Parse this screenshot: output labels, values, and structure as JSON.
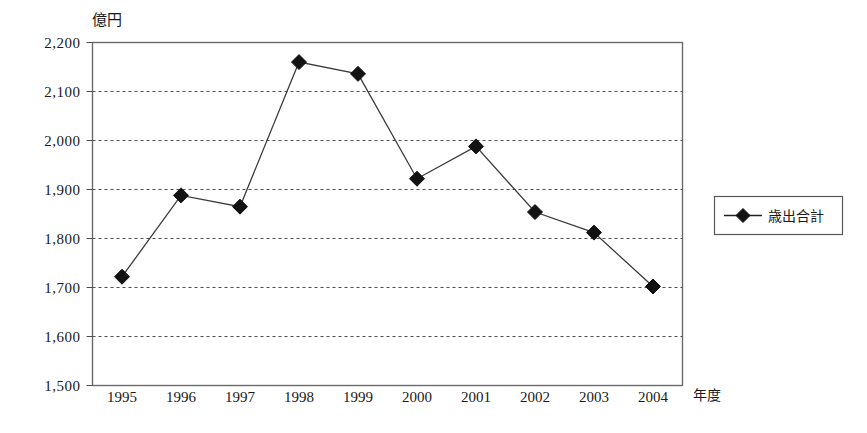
{
  "chart_data": {
    "type": "line",
    "title": "",
    "xlabel": "年度",
    "ylabel": "億円",
    "categories": [
      "1995",
      "1996",
      "1997",
      "1998",
      "1999",
      "2000",
      "2001",
      "2002",
      "2003",
      "2004"
    ],
    "series": [
      {
        "name": "歳出合計",
        "values": [
          1722,
          1888,
          1865,
          2160,
          2136,
          1922,
          1988,
          1854,
          1812,
          1702
        ],
        "marker": "diamond",
        "color": "#121212"
      }
    ],
    "ylim": [
      1500,
      2200
    ],
    "yticks": [
      1500,
      1600,
      1700,
      1800,
      1900,
      2000,
      2100,
      2200
    ],
    "ytick_labels": [
      "1,500",
      "1,600",
      "1,700",
      "1,800",
      "1,900",
      "2,000",
      "2,100",
      "2,200"
    ],
    "grid": true,
    "grid_style": "dashed-horizontal",
    "legend_position": "right",
    "legend_entries": [
      "歳出合計"
    ]
  },
  "axes": {
    "y_unit_label": "億円",
    "x_axis_title": "年度"
  },
  "legend": {
    "items": [
      {
        "label": "歳出合計",
        "marker": "diamond",
        "color": "#121212"
      }
    ]
  },
  "colors": {
    "series": "#121212",
    "grid": "#4d4d4d",
    "border": "#6b6b6b",
    "background": "#ffffff",
    "text": "#1a1a1a"
  }
}
